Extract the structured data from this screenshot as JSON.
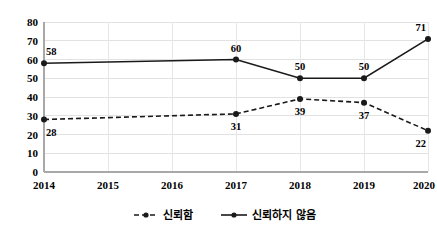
{
  "chart_data": {
    "type": "line",
    "title": "",
    "subtitle": "",
    "xlabel": "",
    "ylabel": "",
    "x": [
      "2014",
      "2015",
      "2016",
      "2017",
      "2018",
      "2019",
      "2020"
    ],
    "categories": [
      "2014",
      "2015",
      "2016",
      "2017",
      "2018",
      "2019",
      "2020"
    ],
    "series": [
      {
        "name": "신뢰함",
        "style": "dashed",
        "marker": "circle",
        "color": "#1a1a1a",
        "values": [
          28,
          null,
          null,
          31,
          39,
          37,
          22
        ],
        "labels": [
          "28",
          "",
          "",
          "31",
          "39",
          "37",
          "22"
        ],
        "label_positions": [
          "below",
          "",
          "",
          "below",
          "below",
          "below",
          "below"
        ]
      },
      {
        "name": "신뢰하지 않음",
        "style": "solid",
        "marker": "circle",
        "color": "#1a1a1a",
        "values": [
          58,
          null,
          null,
          60,
          50,
          50,
          71
        ],
        "labels": [
          "58",
          "",
          "",
          "60",
          "50",
          "50",
          "71"
        ],
        "label_positions": [
          "above",
          "",
          "",
          "above",
          "above",
          "above",
          "above"
        ]
      }
    ],
    "ylim": [
      0,
      80
    ],
    "yticks": [
      0,
      10,
      20,
      30,
      40,
      50,
      60,
      70,
      80
    ],
    "ytick_labels": [
      "0",
      "10",
      "20",
      "30",
      "40",
      "50",
      "60",
      "70",
      "80"
    ],
    "grid": {
      "horizontal": true,
      "vertical": true,
      "color": "#e2e2e2"
    },
    "legend": {
      "position": "bottom",
      "entries": [
        {
          "label": "신뢰함",
          "style": "dashed"
        },
        {
          "label": "신뢰하지 않음",
          "style": "solid"
        }
      ]
    },
    "axis_color": "#a8a8a8",
    "background": "#ffffff"
  }
}
